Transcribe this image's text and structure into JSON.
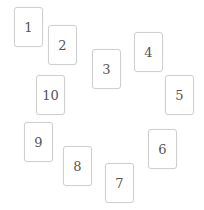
{
  "cards": [
    {
      "label": "1",
      "x": 14,
      "y": 7
    },
    {
      "label": "2",
      "x": 48,
      "y": 25
    },
    {
      "label": "3",
      "x": 92,
      "y": 49
    },
    {
      "label": "4",
      "x": 134,
      "y": 32
    },
    {
      "label": "5",
      "x": 165,
      "y": 75
    },
    {
      "label": "6",
      "x": 148,
      "y": 129
    },
    {
      "label": "7",
      "x": 105,
      "y": 163
    },
    {
      "label": "8",
      "x": 63,
      "y": 146
    },
    {
      "label": "9",
      "x": 24,
      "y": 122
    },
    {
      "label": "10",
      "x": 36,
      "y": 75
    }
  ],
  "colors": {
    "card_border": "#cfcfcf",
    "card_fill": "#ffffff",
    "text": "#555555",
    "background": "#ffffff"
  }
}
